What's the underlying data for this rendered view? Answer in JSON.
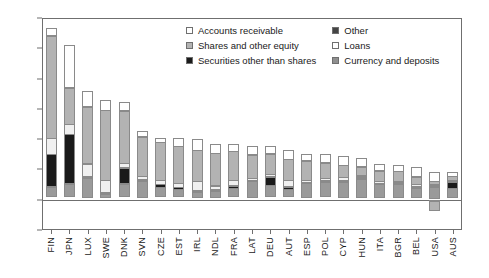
{
  "chart_data": {
    "type": "bar",
    "stacked": true,
    "title": "",
    "subtitle": "",
    "xlabel": "",
    "ylabel": "",
    "ylim": [
      -20,
      120
    ],
    "yticks": [
      -20,
      0,
      20,
      40,
      60,
      80,
      100,
      120
    ],
    "grid": false,
    "legend_position": "top-center",
    "categories": [
      "FIN",
      "JPN",
      "LUX",
      "SWE",
      "DNK",
      "SVN",
      "CZE",
      "EST",
      "IRL",
      "NDL",
      "FRA",
      "LAT",
      "DEU",
      "AUT",
      "ESP",
      "POL",
      "CYP",
      "HUN",
      "ITA",
      "BGR",
      "BEL",
      "USA",
      "AUS"
    ],
    "series": [
      {
        "name": "Currency and deposits",
        "color": "#9a9a9a",
        "values": [
          7.0,
          9.0,
          13.5,
          3.0,
          9.0,
          11.5,
          6.5,
          5.5,
          4.0,
          4.5,
          6.0,
          11.0,
          8.0,
          5.5,
          9.5,
          10.0,
          10.5,
          12.5,
          9.0,
          9.0,
          6.5,
          7.5,
          6.5
        ]
      },
      {
        "name": "Securities other than shares",
        "color": "#1a1a1a",
        "values": [
          22.0,
          33.0,
          0.6,
          0.6,
          11.0,
          0.6,
          2.5,
          1.5,
          1.0,
          1.0,
          2.0,
          0.8,
          6.0,
          2.0,
          1.0,
          1.5,
          1.0,
          1.0,
          0.8,
          1.0,
          0.8,
          0.5,
          4.5
        ]
      },
      {
        "name": "Loans",
        "color": "#f0f0f0",
        "values": [
          11.0,
          7.0,
          9.0,
          8.5,
          3.5,
          2.5,
          3.0,
          3.0,
          6.5,
          3.0,
          4.0,
          1.5,
          2.0,
          4.5,
          1.5,
          2.0,
          2.5,
          1.5,
          1.5,
          1.5,
          2.0,
          1.5,
          1.0
        ]
      },
      {
        "name": "Shares and other equity",
        "color": "#b3b3b3",
        "values": [
          68.0,
          24.5,
          38.0,
          46.5,
          35.0,
          26.5,
          25.5,
          25.0,
          21.0,
          22.0,
          19.5,
          16.0,
          14.0,
          14.5,
          13.5,
          10.5,
          8.5,
          6.5,
          7.5,
          7.0,
          5.5,
          2.5,
          3.0
        ]
      },
      {
        "name": "Accounts receivable",
        "color": "#ffffff",
        "values": [
          5.5,
          29.0,
          10.5,
          7.5,
          6.0,
          4.0,
          3.5,
          6.0,
          7.5,
          6.5,
          5.5,
          6.0,
          5.5,
          6.5,
          4.5,
          6.0,
          6.5,
          6.0,
          5.0,
          4.5,
          7.0,
          6.0,
          3.0
        ]
      },
      {
        "name": "Other",
        "color": "#555555",
        "values": [
          0,
          0,
          0,
          0,
          0,
          0,
          0,
          0,
          0,
          0,
          0,
          0,
          0,
          0,
          0,
          0,
          0,
          0,
          0,
          0,
          0,
          0,
          0
        ]
      }
    ],
    "negative_series": [
      {
        "name": "Loans",
        "color": "#f0f0f0",
        "values": [
          0,
          0,
          0,
          0,
          0,
          0,
          0,
          0,
          0,
          0,
          0,
          0,
          0,
          0,
          0,
          0,
          0,
          0,
          0,
          0,
          0,
          -1.5,
          0
        ]
      },
      {
        "name": "Shares and other equity",
        "color": "#b3b3b3",
        "values": [
          0,
          0,
          0,
          0,
          0,
          0,
          0,
          0,
          0,
          0,
          0,
          0,
          0,
          0,
          0,
          0,
          0,
          0,
          0,
          0,
          0,
          -6.5,
          0
        ]
      }
    ]
  },
  "legend": {
    "items": [
      {
        "label": "Accounts receivable",
        "color": "#ffffff",
        "column": "left"
      },
      {
        "label": "Other",
        "color": "#444444",
        "column": "right"
      },
      {
        "label": "Shares and other equity",
        "color": "#b3b3b3",
        "column": "left"
      },
      {
        "label": "Loans",
        "color": "#ffffff",
        "column": "right"
      },
      {
        "label": "Securities other than shares",
        "color": "#1a1a1a",
        "column": "left"
      },
      {
        "label": "Currency and deposits",
        "color": "#8f8f8f",
        "column": "right"
      }
    ]
  },
  "axis": {
    "y_tick_labels": [
      "120",
      "100",
      "80",
      "60",
      "40",
      "20",
      "0",
      "-20"
    ],
    "x_tick_labels": [
      "FIN",
      "JPN",
      "LUX",
      "SWE",
      "DNK",
      "SVN",
      "CZE",
      "EST",
      "IRL",
      "NDL",
      "FRA",
      "LAT",
      "DEU",
      "AUT",
      "ESP",
      "POL",
      "CYP",
      "HUN",
      "ITA",
      "BGR",
      "BEL",
      "USA",
      "AUS"
    ]
  },
  "colors": {
    "axis": "#6f6f6f",
    "text": "#1a1a1a",
    "background": "#ffffff"
  }
}
